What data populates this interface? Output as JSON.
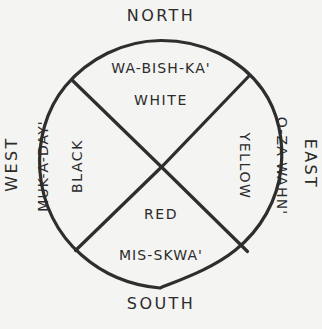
{
  "diagram": {
    "background_color": "#f4f4f2",
    "ink_color": "#2e2e2e",
    "cardinals": {
      "north": "NORTH",
      "south": "SOUTH",
      "east": "EAST",
      "west": "WEST"
    },
    "quadrants": {
      "north": {
        "term": "WA-BISH-KA'",
        "color_name": "WHITE",
        "direction": "NORTH"
      },
      "east": {
        "term": "O-ZA-WAHN'",
        "color_name": "YELLOW",
        "direction": "EAST"
      },
      "south": {
        "term": "MIS-SKWA'",
        "color_name": "RED",
        "direction": "SOUTH"
      },
      "west": {
        "term": "MUK-A-DAY'",
        "color_name": "BLACK",
        "direction": "WEST"
      }
    }
  }
}
